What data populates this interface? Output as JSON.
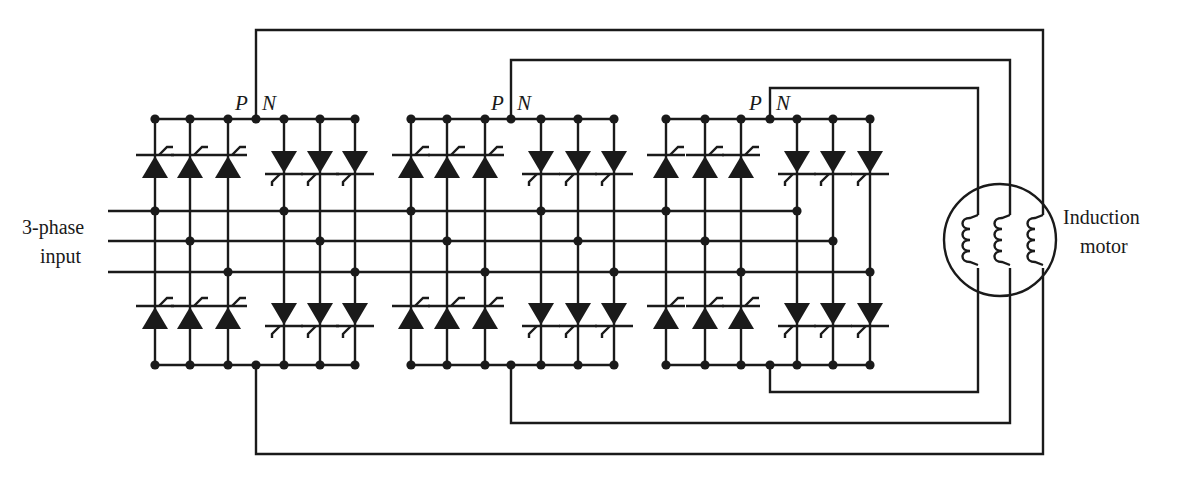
{
  "labels": {
    "input_line1": "3-phase",
    "input_line2": "input",
    "motor_line1": "Induction",
    "motor_line2": "motor",
    "p": "P",
    "n": "N"
  },
  "colors": {
    "ink": "#1a1a1a",
    "background": "#ffffff"
  },
  "geometry": {
    "top_bus_y": 119,
    "bottom_bus_y": 365,
    "input_lines_y": [
      211,
      241,
      272
    ],
    "input_start_x": 108,
    "blocks": [
      {
        "name": "converter-1",
        "positive_cols": [
          155,
          190,
          228
        ],
        "negative_cols": [
          284,
          320,
          355
        ],
        "pn_x": 256,
        "input_taps": [
          [
            155,
            211
          ],
          [
            190,
            241
          ],
          [
            228,
            272
          ],
          [
            284,
            211
          ],
          [
            320,
            241
          ],
          [
            355,
            272
          ]
        ],
        "top_wire_y": 30,
        "bottom_wire_y": 454,
        "motor_x": 1043
      },
      {
        "name": "converter-2",
        "positive_cols": [
          411,
          447,
          485
        ],
        "negative_cols": [
          541,
          578,
          614
        ],
        "pn_x": 511,
        "input_taps": [
          [
            411,
            211
          ],
          [
            447,
            241
          ],
          [
            485,
            272
          ],
          [
            541,
            211
          ],
          [
            578,
            241
          ],
          [
            614,
            272
          ]
        ],
        "top_wire_y": 60,
        "bottom_wire_y": 423,
        "motor_x": 1010
      },
      {
        "name": "converter-3",
        "positive_cols": [
          666,
          705,
          741
        ],
        "negative_cols": [
          797,
          833,
          870
        ],
        "pn_x": 770,
        "input_taps": [
          [
            666,
            211
          ],
          [
            705,
            241
          ],
          [
            741,
            272
          ],
          [
            797,
            211
          ],
          [
            833,
            241
          ],
          [
            870,
            272
          ]
        ],
        "top_wire_y": 88,
        "bottom_wire_y": 392,
        "motor_x": 978
      }
    ],
    "motor": {
      "cx": 1000,
      "cy": 240,
      "r": 56,
      "windings_x": [
        978,
        1010,
        1043
      ]
    }
  }
}
